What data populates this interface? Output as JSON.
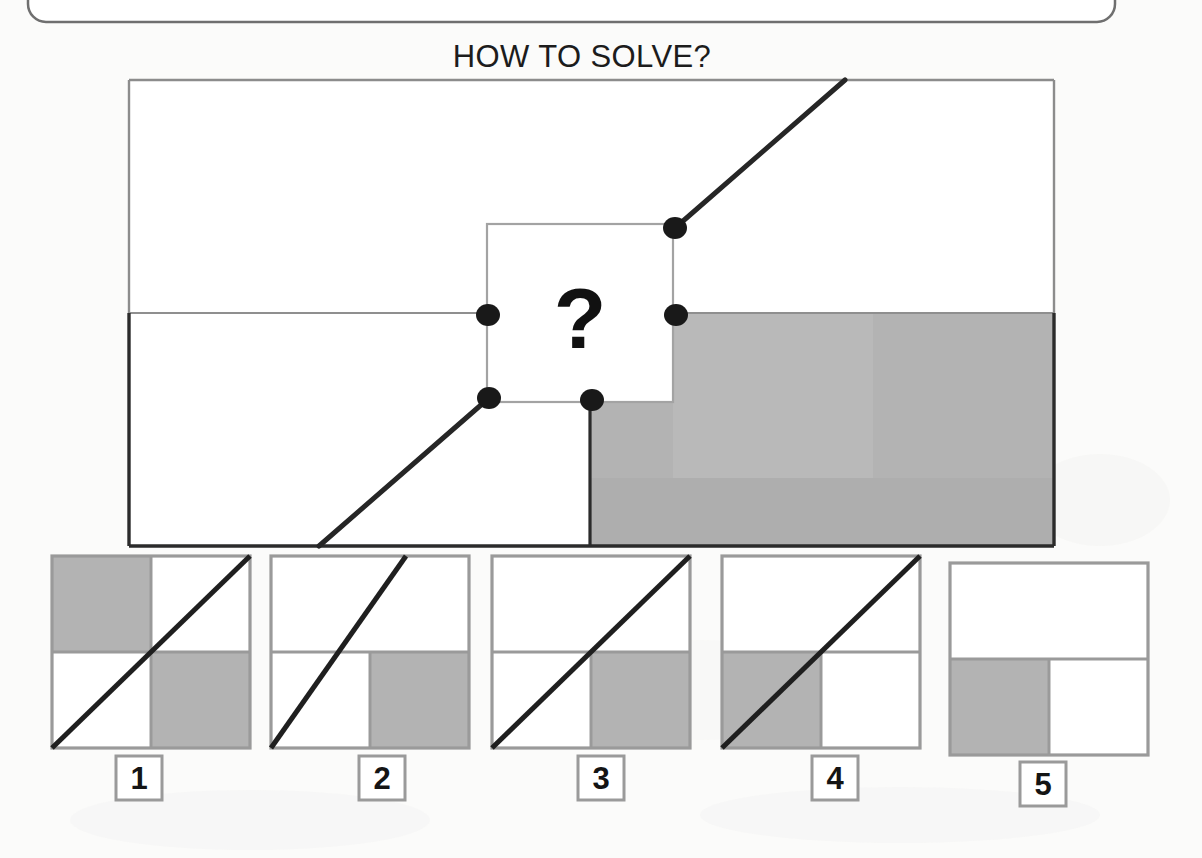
{
  "page": {
    "background_color": "#fbfbfa",
    "width": 1202,
    "height": 858
  },
  "header": {
    "title": "HOW TO SOLVE?",
    "banner_box": {
      "name": "rounded-banner-box",
      "x": 28,
      "y": -60,
      "width": 1087,
      "height": 82,
      "radius": 18,
      "stroke": "#6f6f6f"
    }
  },
  "puzzle": {
    "name": "main-puzzle-figure",
    "frame": {
      "x": 129,
      "y": 80,
      "width": 925,
      "height": 466
    },
    "stroke_color": "#2b2b2b",
    "light_stroke_color": "#8f8f8f",
    "fill_gray": "#b0b0b0",
    "fill_gray_light": "#bdbdbd",
    "divider_y": 313,
    "divider_x": 673,
    "question_box": {
      "x": 487,
      "y": 224,
      "width": 186,
      "height": 178
    },
    "question_mark": "?",
    "gray_region_note": "L-shaped gray: upper part x 673..1054 y 313..402; lower part x 590..1054 y 402..546",
    "dots": [
      {
        "name": "node-top-right",
        "cx": 675,
        "cy": 228,
        "r": 11
      },
      {
        "name": "node-mid-left",
        "cx": 488,
        "cy": 315,
        "r": 11
      },
      {
        "name": "node-mid-right",
        "cx": 676,
        "cy": 315,
        "r": 11
      },
      {
        "name": "node-bottom-left",
        "cx": 489,
        "cy": 398,
        "r": 11
      },
      {
        "name": "node-bottom-mid",
        "cx": 592,
        "cy": 400,
        "r": 11
      }
    ],
    "diagonals": [
      {
        "name": "upper-diagonal",
        "x1": 675,
        "y1": 228,
        "x2": 845,
        "y2": 80
      },
      {
        "name": "lower-diagonal",
        "x1": 489,
        "y1": 398,
        "x2": 319,
        "y2": 546
      }
    ]
  },
  "options": {
    "name": "answer-options",
    "box": {
      "width": 198,
      "height": 192,
      "top": 556
    },
    "num_box": {
      "width": 46,
      "height": 44,
      "top": 756
    },
    "items": [
      {
        "label": "1",
        "x": 52,
        "num_x": 116,
        "shaded_quadrants": [
          "top-left",
          "bottom-right"
        ],
        "diagonal": {
          "x1": 0.0,
          "y1": 1.0,
          "x2": 1.0,
          "y2": 0.0
        },
        "has_diagonal": true
      },
      {
        "label": "2",
        "x": 271,
        "num_x": 359,
        "shaded_quadrants": [
          "bottom-right"
        ],
        "diagonal": {
          "x1": 0.0,
          "y1": 1.0,
          "x2": 0.68,
          "y2": 0.0
        },
        "has_diagonal": true
      },
      {
        "label": "3",
        "x": 492,
        "num_x": 578,
        "shaded_quadrants": [
          "bottom-right"
        ],
        "diagonal": {
          "x1": 0.0,
          "y1": 1.0,
          "x2": 1.0,
          "y2": 0.0
        },
        "has_diagonal": true
      },
      {
        "label": "4",
        "x": 722,
        "num_x": 812,
        "shaded_quadrants": [
          "bottom-left"
        ],
        "diagonal": {
          "x1": 0.0,
          "y1": 1.0,
          "x2": 1.0,
          "y2": 0.0
        },
        "has_diagonal": true
      },
      {
        "label": "5",
        "x": 950,
        "num_x": 1020,
        "shaded_quadrants": [
          "bottom-left"
        ],
        "diagonal": null,
        "has_diagonal": false
      }
    ]
  },
  "colors": {
    "gray_fill": "#b0b0b0",
    "gray_fill_light": "#bebebe",
    "outline_dark": "#2b2b2b",
    "outline_light": "#8f8f8f",
    "option_outline": "#9a9a9a",
    "text": "#141414",
    "paper": "#fbfbfa"
  }
}
